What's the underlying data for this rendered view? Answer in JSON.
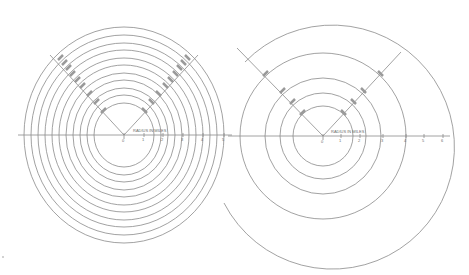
{
  "colors": {
    "line": "#8a8a8a",
    "text": "#6b6b6b",
    "background": "#ffffff"
  },
  "left_diagram": {
    "center": [
      124,
      135
    ],
    "axis_label": "RADIUS IN MILES",
    "ticks": [
      "0",
      "1",
      "2",
      "3",
      "4",
      "5"
    ],
    "rings_rx": [
      30,
      37,
      44,
      51,
      58,
      65,
      72,
      79,
      86,
      93,
      100
    ],
    "ring_aspect": 1.07,
    "diagonal_left_label": "LABELS",
    "diagonal_right_label": "LABELS"
  },
  "right_diagram": {
    "center": [
      323,
      136
    ],
    "axis_label": "RADIUS IN MILES",
    "ticks": [
      "0",
      "1",
      "2",
      "3",
      "4",
      "5",
      "6"
    ],
    "rings_r": [
      30,
      43,
      58,
      83
    ],
    "outer_spiral": "partial outer circle r≈120",
    "diagonal_left_label": "LABELS",
    "diagonal_right_label": "LABELS"
  }
}
